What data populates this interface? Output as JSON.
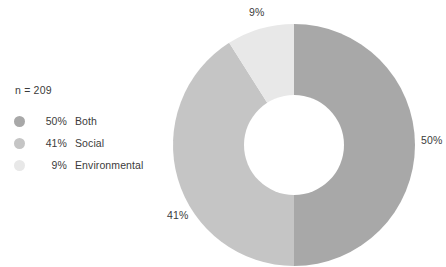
{
  "chart_data": {
    "type": "pie",
    "variant": "donut",
    "title": "",
    "subtitle": "",
    "xlabel": "",
    "ylabel": "",
    "sample_size_label": "n = 209",
    "sample_size": 209,
    "categories": [
      "Both",
      "Social",
      "Environmental"
    ],
    "values": [
      50,
      41,
      9
    ],
    "value_labels": [
      "50%",
      "41%",
      "9%"
    ],
    "units": "percent",
    "legend_position": "left",
    "grid": false,
    "slices": [
      {
        "label": "Both",
        "value": 50,
        "value_label": "50%",
        "color": "#a8a8a8",
        "start_angle_deg": 0,
        "end_angle_deg": 180,
        "callout": "50%"
      },
      {
        "label": "Social",
        "value": 41,
        "value_label": "41%",
        "color": "#c5c5c5",
        "start_angle_deg": 180,
        "end_angle_deg": 327.6,
        "callout": "41%"
      },
      {
        "label": "Environmental",
        "value": 9,
        "value_label": "9%",
        "color": "#e8e8e8",
        "start_angle_deg": 327.6,
        "end_angle_deg": 360,
        "callout": "9%"
      }
    ]
  },
  "legend": {
    "sample_size": "n = 209",
    "items": [
      {
        "percent": "50%",
        "label": "Both",
        "color": "#a8a8a8"
      },
      {
        "percent": "41%",
        "label": "Social",
        "color": "#c5c5c5"
      },
      {
        "percent": "9%",
        "label": "Environmental",
        "color": "#e8e8e8"
      }
    ]
  },
  "callouts": {
    "environmental": "9%",
    "both": "50%",
    "social": "41%"
  },
  "colors": {
    "both": "#a8a8a8",
    "social": "#c5c5c5",
    "environmental": "#e8e8e8",
    "hole": "#ffffff",
    "background": "#ffffff",
    "text": "#3b3b3b"
  }
}
